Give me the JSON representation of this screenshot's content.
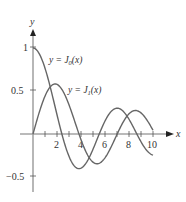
{
  "chart_data": {
    "type": "line",
    "title": "",
    "xlabel": "x",
    "ylabel": "y",
    "xlim": [
      0,
      10.5
    ],
    "ylim": [
      -0.5,
      1.1
    ],
    "x_ticks": [
      1,
      2,
      3,
      4,
      5,
      6,
      7,
      8,
      9,
      10
    ],
    "x_tick_labels": [
      "2",
      "4",
      "6",
      "8",
      "10"
    ],
    "y_tick_labels": [
      "1",
      "0.5",
      "-0.5"
    ],
    "grid": false,
    "legend": "inline annotations",
    "series": [
      {
        "name": "y = J0(x)",
        "label_main": "y = J",
        "label_sub": "0",
        "label_tail": "(x)",
        "x": [
          0,
          1,
          2,
          2.405,
          3,
          3.832,
          4,
          5,
          5.52,
          6,
          7,
          7.016,
          8,
          8.654,
          9,
          10
        ],
        "values": [
          1,
          0.765,
          0.224,
          0,
          -0.26,
          -0.403,
          -0.397,
          -0.178,
          0,
          0.151,
          0.3,
          0.3,
          0.172,
          0,
          -0.09,
          -0.246
        ]
      },
      {
        "name": "y = J1(x)",
        "label_main": "y = J",
        "label_sub": "1",
        "label_tail": "(x)",
        "x": [
          0,
          1,
          1.841,
          2,
          3,
          3.832,
          4,
          5,
          5.331,
          6,
          7,
          7.016,
          8,
          8.536,
          9,
          10
        ],
        "values": [
          0,
          0.44,
          0.582,
          0.577,
          0.339,
          0,
          -0.066,
          -0.328,
          -0.346,
          -0.277,
          -0.005,
          0,
          0.235,
          0.273,
          0.245,
          0.043
        ]
      }
    ]
  },
  "labels": {
    "x_axis": "x",
    "y_axis": "y",
    "y1": "1",
    "y05": "0.5",
    "yneg05": "−0.5",
    "x2": "2",
    "x4": "4",
    "x6": "6",
    "x8": "8",
    "x10": "10",
    "j0_main": "y = J",
    "j0_sub": "0",
    "j0_tail": "(x)",
    "j1_main": "y = J",
    "j1_sub": "1",
    "j1_tail": "(x)"
  }
}
